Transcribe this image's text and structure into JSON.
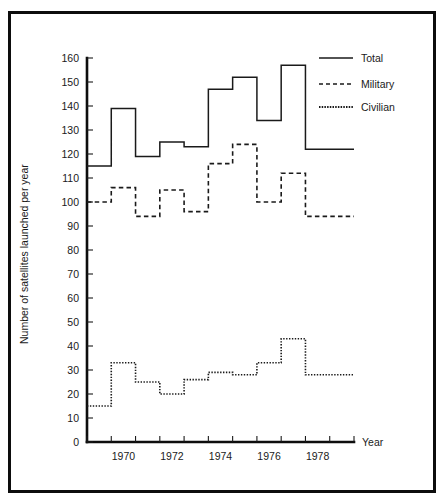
{
  "chart_data": {
    "type": "line",
    "subtype": "step-post",
    "title": "",
    "xlabel": "Year",
    "ylabel": "Number of satellites launched per year",
    "xlim": [
      1969,
      1980
    ],
    "ylim": [
      0,
      160
    ],
    "ytick_step": 10,
    "yticks": [
      0,
      10,
      20,
      30,
      40,
      50,
      60,
      70,
      80,
      90,
      100,
      110,
      120,
      130,
      140,
      150,
      160
    ],
    "ytick_labels": [
      "0",
      "10",
      "20",
      "30",
      "40",
      "50",
      "60",
      "70",
      "80",
      "90",
      "100",
      "110",
      "120",
      "130",
      "140",
      "150",
      "160"
    ],
    "xticks": [
      1969,
      1970,
      1971,
      1972,
      1973,
      1974,
      1975,
      1976,
      1977,
      1978,
      1979,
      1980
    ],
    "xtick_labels_shown": [
      "1970",
      "1972",
      "1974",
      "1976",
      "1978"
    ],
    "xtick_label_years": [
      1970,
      1972,
      1974,
      1976,
      1978
    ],
    "x": [
      1969,
      1970,
      1971,
      1972,
      1973,
      1974,
      1975,
      1976,
      1977,
      1978,
      1979
    ],
    "categories": [
      "1969",
      "1970",
      "1971",
      "1972",
      "1973",
      "1974",
      "1975",
      "1976",
      "1977",
      "1978",
      "1979"
    ],
    "grid": false,
    "legend_position": "top-right",
    "series": [
      {
        "name": "Total",
        "style": "solid",
        "color": "#1a1a1a",
        "values": [
          115,
          139,
          119,
          125,
          123,
          147,
          152,
          134,
          157,
          122,
          122
        ]
      },
      {
        "name": "Military",
        "style": "dashed",
        "color": "#1a1a1a",
        "values": [
          100,
          106,
          94,
          105,
          96,
          116,
          124,
          100,
          112,
          94,
          94
        ]
      },
      {
        "name": "Civilian",
        "style": "dotted",
        "color": "#1a1a1a",
        "values": [
          15,
          33,
          25,
          20,
          26,
          29,
          28,
          33,
          43,
          28,
          28
        ]
      }
    ]
  },
  "legend": {
    "items": [
      {
        "label": "Total"
      },
      {
        "label": "Military"
      },
      {
        "label": "Civilian"
      }
    ]
  },
  "axes": {
    "x_axis_title": "Year",
    "y_axis_title": "Number of satellites launched per year"
  }
}
